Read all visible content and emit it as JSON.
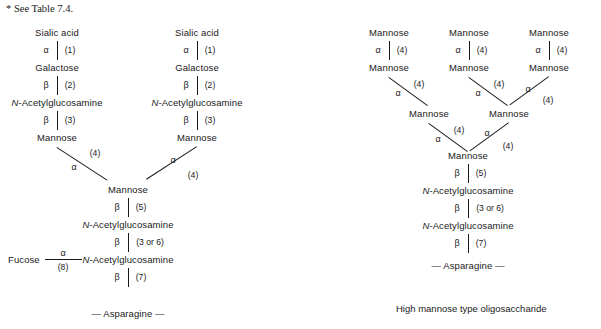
{
  "footnote": {
    "text": "* See Table 7.4."
  },
  "sugars": {
    "sialic_acid": "Sialic acid",
    "galactose": "Galactose",
    "glcnac": "N-Acetylglucosamine",
    "glcnac_prefix": "N",
    "glcnac_rest": "-Acetylglucosamine",
    "mannose": "Mannose",
    "fucose": "Fucose",
    "asparagine": "— Asparagine —"
  },
  "anomeric": {
    "alpha": "α",
    "beta": "β"
  },
  "linkages": {
    "l1": "(1)",
    "l2": "(2)",
    "l3": "(3)",
    "l4": "(4)",
    "l5": "(5)",
    "l3or6": "(3 or 6)",
    "l7": "(7)",
    "l8": "(8)"
  },
  "left_diagram": {
    "name": "complex-type-oligosaccharide",
    "branches": [
      {
        "id": "left-branch",
        "chain": [
          {
            "sugar": "Sialic acid",
            "bond_below": {
              "anomeric": "α",
              "linkage": "(1)"
            }
          },
          {
            "sugar": "Galactose",
            "bond_below": {
              "anomeric": "β",
              "linkage": "(2)"
            }
          },
          {
            "sugar": "N-Acetylglucosamine",
            "bond_below": {
              "anomeric": "β",
              "linkage": "(3)"
            }
          },
          {
            "sugar": "Mannose",
            "bond_below": {
              "anomeric": "α",
              "linkage": "(4)"
            }
          }
        ]
      },
      {
        "id": "right-branch",
        "chain": [
          {
            "sugar": "Sialic acid",
            "bond_below": {
              "anomeric": "α",
              "linkage": "(1)"
            }
          },
          {
            "sugar": "Galactose",
            "bond_below": {
              "anomeric": "β",
              "linkage": "(2)"
            }
          },
          {
            "sugar": "N-Acetylglucosamine",
            "bond_below": {
              "anomeric": "β",
              "linkage": "(3)"
            }
          },
          {
            "sugar": "Mannose",
            "bond_below": {
              "anomeric": "α",
              "linkage": "(4)"
            }
          }
        ]
      }
    ],
    "core": [
      {
        "sugar": "Mannose",
        "bond_below": {
          "anomeric": "β",
          "linkage": "(5)"
        }
      },
      {
        "sugar": "N-Acetylglucosamine",
        "bond_below": {
          "anomeric": "β",
          "linkage": "(3 or 6)"
        }
      },
      {
        "sugar": "N-Acetylglucosamine",
        "bond_below": {
          "anomeric": "β",
          "linkage": "(7)"
        }
      },
      {
        "sugar": "— Asparagine —"
      }
    ],
    "fucose_branch": {
      "sugar": "Fucose",
      "anomeric": "α",
      "linkage": "(8)"
    }
  },
  "right_diagram": {
    "name": "high-mannose-type-oligosaccharide",
    "caption": "High mannose type oligosaccharide",
    "top_arms": [
      {
        "id": "arm-1",
        "upper": "Mannose",
        "anomeric": "α",
        "linkage": "(4)",
        "lower": "Mannose",
        "link_anomeric": "α",
        "link_linkage": "(4)"
      },
      {
        "id": "arm-2",
        "upper": "Mannose",
        "anomeric": "α",
        "linkage": "(4)",
        "lower": "Mannose",
        "link_anomeric": "α",
        "link_linkage": "(4)"
      },
      {
        "id": "arm-3",
        "upper": "Mannose",
        "anomeric": "α",
        "linkage": "(4)",
        "lower": "Mannose",
        "link_anomeric": "α",
        "link_linkage": "(4)"
      }
    ],
    "junctions": [
      {
        "id": "junction-left",
        "sugar": "Mannose",
        "anomeric": "α",
        "linkage": "(4)"
      },
      {
        "id": "junction-right",
        "sugar": "Mannose",
        "anomeric": "α",
        "linkage": "(4)"
      }
    ],
    "core": [
      {
        "sugar": "Mannose",
        "bond_below": {
          "anomeric": "β",
          "linkage": "(5)"
        }
      },
      {
        "sugar": "N-Acetylglucosamine",
        "bond_below": {
          "anomeric": "β",
          "linkage": "(3 or 6)"
        }
      },
      {
        "sugar": "N-Acetylglucosamine",
        "bond_below": {
          "anomeric": "β",
          "linkage": "(7)"
        }
      },
      {
        "sugar": "— Asparagine —"
      }
    ]
  }
}
